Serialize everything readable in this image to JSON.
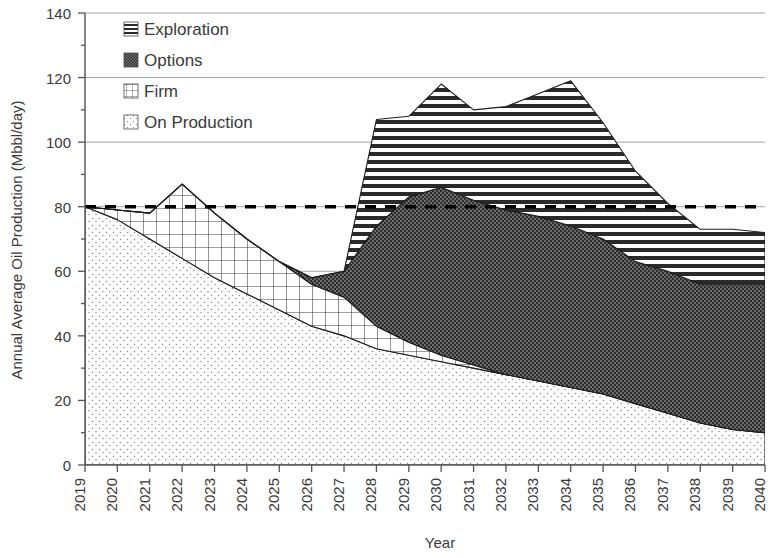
{
  "chart_data": {
    "type": "area",
    "title": "",
    "xlabel": "Year",
    "ylabel": "Annual Average Oil Production (Mbbl/day)",
    "stacked": true,
    "grid": true,
    "legend_position": "upper-left-inside",
    "xlim": [
      2019,
      2040
    ],
    "ylim": [
      0,
      140
    ],
    "ytick_step": 20,
    "yminor_step": 10,
    "yticks": [
      0,
      20,
      40,
      60,
      80,
      100,
      120,
      140
    ],
    "categories": [
      2019,
      2020,
      2021,
      2022,
      2023,
      2024,
      2025,
      2026,
      2027,
      2028,
      2029,
      2030,
      2031,
      2032,
      2033,
      2034,
      2035,
      2036,
      2037,
      2038,
      2039,
      2040
    ],
    "xtick_labels": [
      "2019",
      "2020",
      "2021",
      "2022",
      "2023",
      "2024",
      "2025",
      "2026",
      "2027",
      "2028",
      "2029",
      "2030",
      "2031",
      "2032",
      "2033",
      "2034",
      "2035",
      "2036",
      "2037",
      "2038",
      "2039",
      "2040"
    ],
    "series": [
      {
        "name": "On Production",
        "pattern": "dots",
        "values": [
          80,
          76,
          70,
          64,
          58,
          53,
          48,
          43,
          40,
          36,
          34,
          32,
          30,
          28,
          26,
          24,
          22,
          19,
          16,
          13,
          11,
          10
        ]
      },
      {
        "name": "Firm",
        "pattern": "grid",
        "values": [
          0,
          3,
          8,
          23,
          20,
          17,
          15,
          13,
          12,
          7,
          4,
          2,
          1,
          0,
          0,
          0,
          0,
          0,
          0,
          0,
          0,
          0
        ]
      },
      {
        "name": "Options",
        "pattern": "dense-dark",
        "values": [
          0,
          0,
          0,
          0,
          0,
          0,
          0,
          2,
          8,
          31,
          45,
          52,
          51,
          51,
          51,
          50,
          48,
          44,
          44,
          43,
          45,
          46
        ]
      },
      {
        "name": "Exploration",
        "pattern": "horizontal-lines",
        "values": [
          0,
          0,
          0,
          0,
          0,
          0,
          0,
          0,
          0,
          33,
          25,
          32,
          28,
          32,
          38,
          45,
          36,
          28,
          21,
          17,
          17,
          16
        ]
      }
    ],
    "totals": [
      80,
      79,
      78,
      87,
      78,
      70,
      63,
      58,
      60,
      107,
      108,
      118,
      110,
      111,
      115,
      119,
      106,
      91,
      81,
      73,
      73,
      72
    ],
    "reference_line": {
      "label": "",
      "value": 80,
      "style": "dashed",
      "color": "#000000"
    }
  },
  "legend": {
    "items": [
      {
        "label": "Exploration",
        "pattern": "horizontal-lines"
      },
      {
        "label": "Options",
        "pattern": "dense-dark"
      },
      {
        "label": "Firm",
        "pattern": "grid"
      },
      {
        "label": "On Production",
        "pattern": "dots"
      }
    ]
  },
  "axes": {
    "y_title": "Annual Average Oil Production (Mbbl/day)",
    "x_title": "Year"
  },
  "colors": {
    "axis": "#555555",
    "grid": "#9a9a9a",
    "text": "#3a3a3a",
    "reference": "#000000",
    "pattern_dark": "#2b2b2b",
    "pattern_mid": "#1a1a1a",
    "pattern_light": "#808080"
  }
}
